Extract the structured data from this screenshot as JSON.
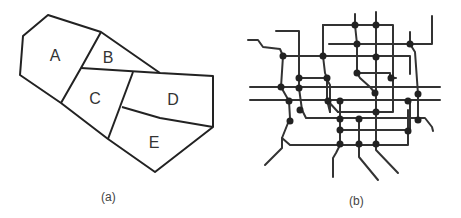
{
  "panels": [
    {
      "id": "a",
      "caption": "(a)",
      "type": "polygon-partition",
      "regions": [
        {
          "label": "A",
          "x": 55,
          "y": 61
        },
        {
          "label": "B",
          "x": 108,
          "y": 63
        },
        {
          "label": "C",
          "x": 95,
          "y": 104
        },
        {
          "label": "D",
          "x": 173,
          "y": 105
        },
        {
          "label": "E",
          "x": 154,
          "y": 148
        }
      ]
    },
    {
      "id": "b",
      "caption": "(b)",
      "type": "network-graph"
    }
  ],
  "colors": {
    "stroke": "#222222",
    "node": "#222222",
    "label": "#333333",
    "background": "#ffffff"
  }
}
